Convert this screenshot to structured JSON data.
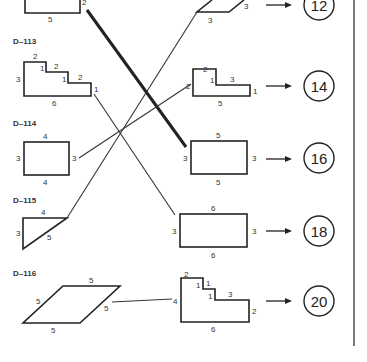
{
  "left_items": [
    {
      "code": "",
      "shape": "rectangle (partial)",
      "labels": [
        "2",
        "5"
      ]
    },
    {
      "code": "D–113",
      "shape": "staircase",
      "labels": [
        "2",
        "1",
        "2",
        "1",
        "2",
        "1",
        "3",
        "6"
      ]
    },
    {
      "code": "D–114",
      "shape": "rectangle",
      "labels": [
        "4",
        "3",
        "3",
        "4"
      ]
    },
    {
      "code": "D–115",
      "shape": "right triangle",
      "labels": [
        "4",
        "3",
        "5"
      ]
    },
    {
      "code": "D–116",
      "shape": "rhombus",
      "labels": [
        "5",
        "5",
        "5",
        "5"
      ]
    }
  ],
  "right_items": [
    {
      "shape": "parallelogram (partial)",
      "labels": [
        "3",
        "3"
      ],
      "answer": "12"
    },
    {
      "shape": "L-shape",
      "labels": [
        "2",
        "1",
        "3",
        "2",
        "1",
        "5"
      ],
      "answer": "14"
    },
    {
      "shape": "rectangle",
      "labels": [
        "5",
        "3",
        "3",
        "5"
      ],
      "answer": "16"
    },
    {
      "shape": "rectangle",
      "labels": [
        "6",
        "3",
        "3",
        "6"
      ],
      "answer": "18"
    },
    {
      "shape": "staircase",
      "labels": [
        "2",
        "1",
        "1",
        "1",
        "3",
        "4",
        "2",
        "6"
      ],
      "answer": "20"
    }
  ],
  "connections": [
    {
      "from": "left_items.0",
      "to": "right_items.2",
      "style": "thick"
    },
    {
      "from": "left_items.1",
      "to": "right_items.3",
      "style": "thin"
    },
    {
      "from": "left_items.2",
      "to": "right_items.1",
      "style": "thin"
    },
    {
      "from": "left_items.3",
      "to": "right_items.0",
      "style": "thin"
    },
    {
      "from": "left_items.4",
      "to": "right_items.4",
      "style": "thin"
    }
  ]
}
